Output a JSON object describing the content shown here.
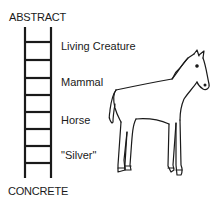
{
  "diagram": {
    "top_label": "ABSTRACT",
    "bottom_label": "CONCRETE",
    "levels": [
      {
        "label": "Living Creature"
      },
      {
        "label": "Mammal"
      },
      {
        "label": "Horse"
      },
      {
        "label": "\"Silver\""
      }
    ],
    "illustration": "horse-drawing",
    "colors": {
      "line": "#1a1a1a",
      "background": "#ffffff"
    }
  }
}
